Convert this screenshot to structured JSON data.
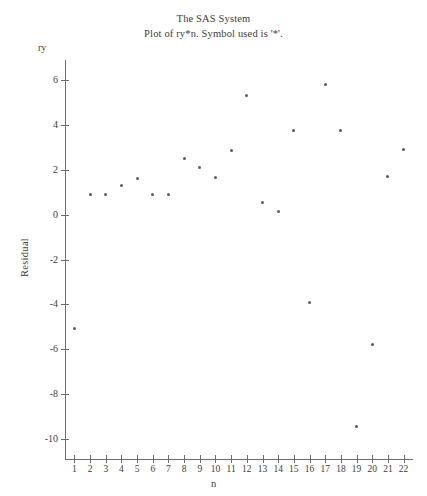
{
  "title": {
    "main": "The SAS System",
    "sub": "Plot of ry*n. Symbol used is '*'."
  },
  "axes": {
    "y_var_label": "ry",
    "y_axis_title": "Residual",
    "x_axis_title": "n"
  },
  "chart_data": {
    "type": "scatter",
    "title": "The SAS System",
    "subtitle": "Plot of ry*n. Symbol used is '*'.",
    "xlabel": "n",
    "ylabel": "Residual",
    "y_var_label": "ry",
    "symbol": "*",
    "grid": false,
    "legend": null,
    "xlim": [
      0.4,
      22.6
    ],
    "ylim": [
      -10.9,
      6.9
    ],
    "xticks": [
      1,
      2,
      3,
      4,
      5,
      6,
      7,
      8,
      9,
      10,
      11,
      12,
      13,
      14,
      15,
      16,
      17,
      18,
      19,
      20,
      21,
      22
    ],
    "yticks": [
      6,
      4,
      2,
      0,
      -2,
      -4,
      -6,
      -8,
      -10
    ],
    "xticklabels": [
      "1",
      "2",
      "3",
      "4",
      "5",
      "6",
      "7",
      "8",
      "9",
      "10",
      "11",
      "12",
      "13",
      "14",
      "15",
      "16",
      "17",
      "18",
      "19",
      "20",
      "21",
      "22"
    ],
    "yticklabels": [
      "6",
      "4",
      "2",
      "0",
      "-2",
      "-4",
      "-6",
      "-8",
      "-10"
    ],
    "x": [
      1,
      2,
      3,
      4,
      5,
      6,
      7,
      8,
      9,
      10,
      11,
      12,
      13,
      14,
      15,
      16,
      17,
      18,
      19,
      20,
      21,
      22
    ],
    "y": [
      -5.1,
      0.9,
      0.9,
      1.3,
      1.6,
      0.9,
      0.9,
      2.5,
      2.1,
      1.65,
      2.85,
      5.3,
      0.55,
      0.15,
      3.75,
      -3.9,
      5.8,
      3.75,
      -9.45,
      -5.8,
      1.7,
      2.9
    ]
  }
}
